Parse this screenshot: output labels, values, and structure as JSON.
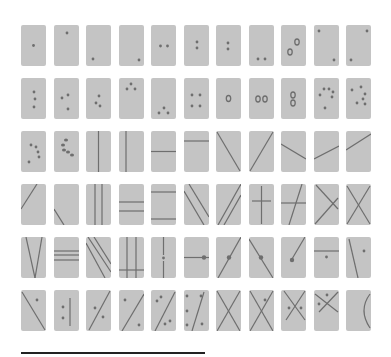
{
  "figure": {
    "colors": {
      "card": "#c4c4c4",
      "mark": "#6e6e6e",
      "background": "#ffffff",
      "rule": "#222222"
    },
    "grid": {
      "columns": 11,
      "rows": 6,
      "origin_x": 21,
      "origin_y": 25,
      "pitch_x": 32.5,
      "pitch_y": 53,
      "card_w": 25,
      "card_h": 41
    },
    "scale_bar": {
      "x1": 21,
      "x2": 205,
      "y": 353
    }
  },
  "cards": [
    {
      "dots": [
        [
          12.5,
          20.5
        ]
      ]
    },
    {
      "dots": [
        [
          13,
          8
        ]
      ]
    },
    {
      "dots": [
        [
          7,
          34
        ]
      ]
    },
    {
      "dots": [
        [
          20,
          35
        ]
      ]
    },
    {
      "dots": [
        [
          9.5,
          21
        ],
        [
          16.5,
          21
        ]
      ]
    },
    {
      "dots": [
        [
          13,
          17
        ],
        [
          13,
          23
        ]
      ]
    },
    {
      "dots": [
        [
          12,
          18
        ],
        [
          12,
          24
        ]
      ]
    },
    {
      "dots": [
        [
          9,
          34
        ],
        [
          16,
          34
        ]
      ]
    },
    {
      "ovals": [
        [
          16,
          17
        ],
        [
          9,
          27
        ]
      ]
    },
    {
      "dots": [
        [
          5,
          6
        ],
        [
          20,
          35
        ]
      ]
    },
    {
      "dots": [
        [
          21,
          6
        ],
        [
          5,
          35
        ]
      ]
    },
    {
      "dots": [
        [
          13,
          14
        ],
        [
          14,
          21
        ],
        [
          13,
          29
        ]
      ]
    },
    {
      "dots": [
        [
          8,
          20
        ],
        [
          14,
          17
        ],
        [
          14,
          31
        ]
      ]
    },
    {
      "dots": [
        [
          13,
          18
        ],
        [
          10,
          25
        ],
        [
          14,
          28
        ]
      ]
    },
    {
      "dots": [
        [
          12,
          6
        ],
        [
          8,
          11
        ],
        [
          16,
          11
        ]
      ]
    },
    {
      "dots": [
        [
          13,
          30
        ],
        [
          8,
          35
        ],
        [
          17,
          35
        ]
      ]
    },
    {
      "dots": [
        [
          8,
          17
        ],
        [
          16,
          17
        ],
        [
          8,
          28
        ],
        [
          16,
          28
        ]
      ]
    },
    {
      "ovals": [
        [
          12.5,
          20.5
        ]
      ]
    },
    {
      "ovals": [
        [
          9,
          21
        ],
        [
          16,
          21
        ]
      ]
    },
    {
      "ovals": [
        [
          12,
          17
        ],
        [
          12,
          25
        ]
      ]
    },
    {
      "dots": [
        [
          6,
          17
        ],
        [
          10,
          11
        ],
        [
          15,
          11
        ],
        [
          19,
          14
        ],
        [
          18,
          19
        ],
        [
          11,
          30
        ]
      ]
    },
    {
      "dots": [
        [
          6,
          12
        ],
        [
          15,
          9
        ],
        [
          19,
          16
        ],
        [
          17,
          21
        ],
        [
          11,
          25
        ],
        [
          19,
          26
        ]
      ]
    },
    {
      "dots": [
        [
          10,
          14
        ],
        [
          15,
          16
        ],
        [
          17,
          21
        ],
        [
          18,
          26
        ],
        [
          8,
          31
        ]
      ]
    },
    {
      "ovals_small": [
        [
          12,
          9
        ],
        [
          9,
          14
        ],
        [
          10,
          19
        ],
        [
          14,
          21
        ],
        [
          18,
          24
        ]
      ]
    },
    {
      "lines": [
        [
          12.5,
          0,
          12.5,
          41
        ]
      ]
    },
    {
      "lines": [
        [
          7,
          0,
          7,
          41
        ]
      ]
    },
    {
      "lines": [
        [
          0,
          20.5,
          25,
          20.5
        ]
      ]
    },
    {
      "lines": [
        [
          0,
          10,
          25,
          10
        ]
      ]
    },
    {
      "lines": [
        [
          1,
          1,
          24,
          40
        ]
      ]
    },
    {
      "lines": [
        [
          24,
          1,
          1,
          40
        ]
      ]
    },
    {
      "lines": [
        [
          0,
          13,
          25,
          28
        ]
      ]
    },
    {
      "lines": [
        [
          0,
          28,
          25,
          15
        ]
      ]
    },
    {
      "lines": [
        [
          0,
          19,
          25,
          3
        ]
      ]
    },
    {
      "lines": [
        [
          0,
          25,
          16,
          0
        ]
      ]
    },
    {
      "lines": [
        [
          0,
          25,
          10,
          41
        ]
      ]
    },
    {
      "lines": [
        [
          9,
          0,
          9,
          41
        ],
        [
          16,
          0,
          16,
          41
        ]
      ]
    },
    {
      "lines": [
        [
          0,
          18,
          25,
          18
        ],
        [
          0,
          27,
          25,
          27
        ]
      ]
    },
    {
      "lines": [
        [
          0,
          8,
          25,
          8
        ],
        [
          0,
          35,
          25,
          35
        ]
      ]
    },
    {
      "lines": [
        [
          0,
          7,
          20,
          41
        ],
        [
          5,
          0,
          25,
          33
        ]
      ]
    },
    {
      "lines": [
        [
          2,
          41,
          25,
          0
        ],
        [
          8,
          41,
          25,
          11
        ]
      ]
    },
    {
      "lines": [
        [
          12.5,
          2,
          12.5,
          40
        ],
        [
          3,
          17,
          22,
          17
        ]
      ]
    },
    {
      "lines": [
        [
          8,
          41,
          21,
          0
        ],
        [
          0,
          19,
          25,
          19
        ]
      ]
    },
    {
      "lines": [
        [
          2,
          1,
          24,
          25
        ],
        [
          1,
          40,
          24,
          14
        ]
      ]
    },
    {
      "lines": [
        [
          1,
          2,
          24,
          40
        ],
        [
          24,
          2,
          1,
          40
        ]
      ]
    },
    {
      "lines": [
        [
          5,
          0,
          14,
          41
        ],
        [
          21,
          0,
          14,
          41
        ]
      ]
    },
    {
      "lines": [
        [
          0,
          14,
          25,
          14
        ],
        [
          0,
          18,
          25,
          18
        ],
        [
          0,
          23,
          25,
          23
        ]
      ]
    },
    {
      "lines": [
        [
          0,
          6,
          19,
          41
        ],
        [
          2,
          0,
          25,
          35
        ],
        [
          8,
          0,
          25,
          27
        ]
      ]
    },
    {
      "lines": [
        [
          8,
          0,
          8,
          41
        ],
        [
          17,
          0,
          17,
          41
        ],
        [
          0,
          33,
          25,
          33
        ]
      ]
    },
    {
      "lines": [
        [
          12.5,
          0,
          12.5,
          18
        ],
        [
          12.5,
          24,
          12.5,
          41
        ]
      ],
      "dots": [
        [
          12.5,
          21
        ]
      ]
    },
    {
      "lines": [
        [
          0,
          20.5,
          25,
          20.5
        ]
      ],
      "bigdots": [
        [
          20,
          20.5
        ]
      ]
    },
    {
      "lines": [
        [
          2,
          41,
          25,
          0
        ]
      ],
      "bigdots": [
        [
          13,
          20.5
        ]
      ]
    },
    {
      "lines": [
        [
          0,
          2,
          24,
          41
        ]
      ],
      "bigdots": [
        [
          12,
          20.5
        ]
      ]
    },
    {
      "lines": [
        [
          11,
          22,
          24,
          0
        ]
      ],
      "bigdots": [
        [
          11,
          23
        ]
      ]
    },
    {
      "lines": [
        [
          0,
          14,
          25,
          14
        ]
      ],
      "dots": [
        [
          12.5,
          20
        ]
      ]
    },
    {
      "lines": [
        [
          3,
          2,
          12,
          41
        ]
      ],
      "dots": [
        [
          18,
          14
        ]
      ]
    },
    {
      "lines": [
        [
          1,
          2,
          24,
          40
        ]
      ],
      "dots": [
        [
          16,
          10
        ]
      ]
    },
    {
      "lines": [
        [
          16,
          8,
          16,
          36
        ]
      ],
      "dots": [
        [
          9,
          17
        ],
        [
          9,
          28
        ]
      ]
    },
    {
      "lines": [
        [
          24,
          1,
          3,
          40
        ]
      ],
      "dots": [
        [
          9,
          18
        ],
        [
          17,
          27
        ]
      ]
    },
    {
      "lines": [
        [
          25,
          4,
          3,
          41
        ]
      ],
      "dots": [
        [
          6,
          10
        ],
        [
          20,
          35
        ]
      ]
    },
    {
      "lines": [
        [
          24,
          2,
          4,
          41
        ]
      ],
      "dots": [
        [
          10,
          7
        ],
        [
          6,
          11
        ],
        [
          14,
          34
        ],
        [
          19,
          31
        ]
      ]
    },
    {
      "lines": [
        [
          20,
          2,
          8,
          41
        ]
      ],
      "dots": [
        [
          3,
          6
        ],
        [
          3,
          21
        ],
        [
          3,
          35
        ],
        [
          17,
          6
        ],
        [
          18,
          34
        ]
      ]
    },
    {
      "lines": [
        [
          1,
          1,
          24,
          41
        ],
        [
          24,
          1,
          1,
          41
        ]
      ]
    },
    {
      "lines": [
        [
          1,
          1,
          24,
          41
        ],
        [
          24,
          1,
          1,
          41
        ]
      ],
      "dots": [
        [
          16,
          10
        ]
      ]
    },
    {
      "lines": [
        [
          3,
          1,
          24,
          30
        ],
        [
          24,
          1,
          5,
          30
        ]
      ],
      "dots": [
        [
          8,
          18
        ],
        [
          20,
          18
        ]
      ]
    },
    {
      "lines": [
        [
          1,
          4,
          24,
          22
        ],
        [
          24,
          2,
          5,
          22
        ]
      ],
      "dots": [
        [
          13,
          5
        ],
        [
          5,
          14
        ]
      ]
    },
    {
      "arcs": [
        [
          "M24 4 Q12 20 24 38"
        ]
      ]
    }
  ]
}
